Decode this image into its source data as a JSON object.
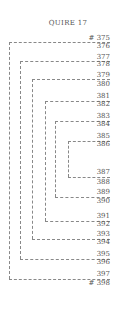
{
  "title": "QUIRE 17",
  "leaves": [
    "# 375",
    "376",
    "377",
    "378",
    "379",
    "380",
    "381",
    "382",
    "383",
    "384",
    "385",
    "386",
    "387",
    "388",
    "389",
    "390",
    "391",
    "392",
    "393",
    "394",
    "395",
    "396",
    "397",
    "# 398"
  ],
  "label_y": [
    34,
    42,
    53,
    60,
    71,
    80,
    92,
    100,
    112,
    120,
    132,
    140,
    168,
    178,
    188,
    197,
    212,
    220,
    230,
    238,
    250,
    258,
    270,
    279
  ],
  "bifolia": [
    {
      "top": "375",
      "bottom": "397",
      "x": 9,
      "y1": 42,
      "y2": 279
    },
    {
      "top": "377",
      "bottom": "395",
      "x": 20,
      "y1": 61,
      "y2": 259
    },
    {
      "top": "379",
      "bottom": "393",
      "x": 32,
      "y1": 79,
      "y2": 239
    },
    {
      "top": "381",
      "bottom": "391",
      "x": 45,
      "y1": 101,
      "y2": 221
    },
    {
      "top": "383",
      "bottom": "389",
      "x": 55,
      "y1": 121,
      "y2": 197
    },
    {
      "top": "385",
      "bottom": "387",
      "x": 68,
      "y1": 141,
      "y2": 177
    }
  ],
  "line_right": 110
}
